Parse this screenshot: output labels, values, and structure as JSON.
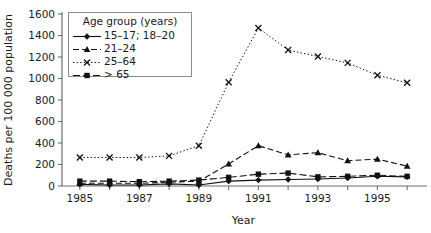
{
  "chart_data": {
    "type": "line",
    "title": "",
    "xlabel": "Year",
    "ylabel": "Deaths per 100 000 population",
    "xlim": [
      1984.4,
      1996.6
    ],
    "ylim": [
      0,
      1600
    ],
    "yticks": [
      0,
      200,
      400,
      600,
      800,
      1000,
      1200,
      1400,
      1600
    ],
    "ytick_labels": [
      "0",
      "200",
      "400",
      "600",
      "800",
      "1000",
      "1200",
      "1400",
      "1600"
    ],
    "xticks": [
      1985,
      1986,
      1987,
      1988,
      1989,
      1990,
      1991,
      1992,
      1993,
      1994,
      1995,
      1996
    ],
    "xtick_labels": [
      "1985",
      "",
      "1987",
      "",
      "1989",
      "",
      "1991",
      "",
      "1993",
      "",
      "1995",
      ""
    ],
    "grid": false,
    "legend_position": "upper-left",
    "legend_title": "Age group (years)",
    "x": [
      1985,
      1986,
      1987,
      1988,
      1989,
      1990,
      1991,
      1992,
      1993,
      1994,
      1995,
      1996
    ],
    "series": [
      {
        "name": "15–17; 18–20",
        "marker": "diamond",
        "linestyle": "solid",
        "values": [
          15,
          10,
          10,
          20,
          10,
          45,
          55,
          60,
          65,
          75,
          90,
          85
        ]
      },
      {
        "name": "21–24",
        "marker": "triangle",
        "linestyle": "dashed",
        "values": [
          25,
          25,
          25,
          35,
          45,
          205,
          375,
          290,
          310,
          235,
          250,
          185
        ]
      },
      {
        "name": "25–64",
        "marker": "x",
        "linestyle": "dotted",
        "values": [
          265,
          265,
          265,
          280,
          375,
          965,
          1470,
          1265,
          1205,
          1145,
          1030,
          960
        ]
      },
      {
        "name": "> 65",
        "marker": "square",
        "linestyle": "dashdot",
        "values": [
          45,
          45,
          40,
          45,
          55,
          80,
          110,
          120,
          85,
          90,
          100,
          90
        ]
      }
    ]
  },
  "legend": {
    "title": "Age group (years)",
    "items": [
      {
        "label": "15–17; 18–20",
        "marker": "diamond",
        "linestyle": "solid"
      },
      {
        "label": "21–24",
        "marker": "triangle",
        "linestyle": "dashed"
      },
      {
        "label": "25–64",
        "marker": "x",
        "linestyle": "dotted"
      },
      {
        "label": "> 65",
        "marker": "square",
        "linestyle": "dashdot"
      }
    ]
  },
  "colors": {
    "line": "#111111",
    "axis": "#6e6e6e",
    "text": "#1a1a1a",
    "legend_border": "#8c8c8c",
    "background": "#ffffff"
  }
}
